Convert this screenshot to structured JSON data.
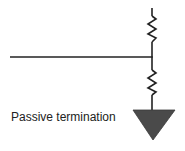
{
  "diagram": {
    "title": "Passive termination",
    "label": "Passive termination",
    "components": [
      {
        "type": "wire",
        "name": "signal-line",
        "orientation": "horizontal"
      },
      {
        "type": "resistor",
        "name": "pull-up-resistor",
        "position": "upper"
      },
      {
        "type": "resistor",
        "name": "pull-down-resistor",
        "position": "lower"
      },
      {
        "type": "ground",
        "name": "ground-symbol",
        "shape": "filled-triangle"
      }
    ],
    "colors": {
      "line": "#222222",
      "ground_fill": "#4a4a4a",
      "background": "#ffffff"
    }
  }
}
